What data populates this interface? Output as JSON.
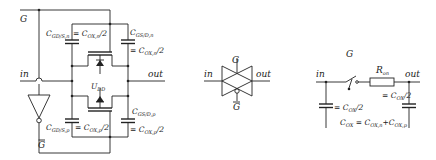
{
  "figure": {
    "left_circuit": {
      "title": "CMOS transmission gate with parasitic capacitances",
      "labels": {
        "gate": "G",
        "gate_bar": "G",
        "input": "in",
        "output": "out",
        "supply": "U",
        "supply_sub": "DD"
      },
      "capacitors": [
        {
          "name": "C",
          "sub": "GD/S,n",
          "value": "= C",
          "value_sub": "OX,n",
          "value_tail": "/2"
        },
        {
          "name": "C",
          "sub": "GS/D,n",
          "value": "= C",
          "value_sub": "OX,n",
          "value_tail": "/2"
        },
        {
          "name": "C",
          "sub": "GS/D,p",
          "value": "= C",
          "value_sub": "OX,p",
          "value_tail": "/2"
        },
        {
          "name": "C",
          "sub": "GD/S,p",
          "value": "= C",
          "value_sub": "OX,p",
          "value_tail": "/2"
        }
      ]
    },
    "middle_symbol": {
      "title": "Transmission gate symbol",
      "labels": {
        "gate": "G",
        "gate_bar": "G",
        "input": "in",
        "output": "out"
      }
    },
    "right_model": {
      "title": "Switch equivalent model",
      "labels": {
        "gate": "G",
        "input": "in",
        "output": "out",
        "resistor": "R",
        "resistor_sub": "on",
        "cap_in": "= C",
        "cap_in_sub": "OX",
        "cap_in_tail": "/2",
        "cap_out": "= C",
        "cap_out_sub": "OX",
        "cap_out_tail": "/2",
        "eq_lhs": "C",
        "eq_lhs_sub": "OX",
        "eq_mid": " = C",
        "eq_mid_sub": "OX,n",
        "eq_plus": "+C",
        "eq_plus_sub": "OX,p"
      }
    }
  }
}
